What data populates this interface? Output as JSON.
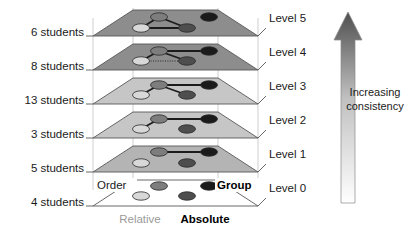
{
  "figure": {
    "type": "diagram",
    "width": 405,
    "height": 232
  },
  "colors": {
    "plane_dark": "#8d8d8d",
    "plane_mid": "#b4b4b4",
    "plane_light": "#c6c6c6",
    "plane_empty": "#ffffff",
    "edge": "#58585a",
    "pillar": "#c9c9c9",
    "connector": "#1b1b1b",
    "node_light": "#d8d8d8",
    "node_mid": "#8a8a8a",
    "node_dark": "#5a5a5a",
    "node_black": "#1b1b1b",
    "text": "#1a1a1a",
    "text_gray": "#9a9a9a",
    "arrow_top": "#595959",
    "arrow_bottom": "#ffffff"
  },
  "left_labels": [
    {
      "text": "6 students",
      "level": 5
    },
    {
      "text": "8 students",
      "level": 4
    },
    {
      "text": "13 students",
      "level": 3
    },
    {
      "text": "3 students",
      "level": 2
    },
    {
      "text": "5 students",
      "level": 1
    },
    {
      "text": "4 students",
      "level": 0
    }
  ],
  "right_labels": [
    {
      "text": "Level 5"
    },
    {
      "text": "Level 4"
    },
    {
      "text": "Level 3"
    },
    {
      "text": "Level 2"
    },
    {
      "text": "Level 1"
    },
    {
      "text": "Level 0"
    }
  ],
  "axis_labels": {
    "back_left": "Order",
    "back_right": "Group",
    "front_left": "Relative",
    "front_right": "Absolute"
  },
  "arrow": {
    "line1": "Increasing",
    "line2": "consistency",
    "direction": "up"
  },
  "levels": [
    {
      "name": "Level 5",
      "students": "6 students",
      "fill": "#8d8d8d",
      "nodes": [
        {
          "id": "relative-order",
          "shade": "#d8d8d8"
        },
        {
          "id": "absolute-order",
          "shade": "#7d7d7d"
        },
        {
          "id": "relative-group",
          "shade": "#4e4e4e"
        },
        {
          "id": "absolute-group",
          "shade": "#1b1b1b"
        }
      ],
      "links": [
        {
          "from": "relative-order",
          "to": "absolute-order",
          "style": "solid"
        },
        {
          "from": "absolute-order",
          "to": "relative-group",
          "style": "solid"
        },
        {
          "from": "relative-group",
          "to": "relative-order",
          "style": "solid"
        }
      ]
    },
    {
      "name": "Level 4",
      "students": "8 students",
      "fill": "#8d8d8d",
      "nodes": [
        {
          "id": "relative-order",
          "shade": "#d8d8d8"
        },
        {
          "id": "absolute-order",
          "shade": "#7d7d7d"
        },
        {
          "id": "relative-group",
          "shade": "#4e4e4e"
        },
        {
          "id": "absolute-group",
          "shade": "#1b1b1b"
        }
      ],
      "links": [
        {
          "from": "relative-order",
          "to": "absolute-order",
          "style": "solid"
        },
        {
          "from": "absolute-order",
          "to": "relative-group",
          "style": "solid"
        },
        {
          "from": "relative-order",
          "to": "relative-group",
          "style": "dotted"
        },
        {
          "from": "absolute-order",
          "to": "absolute-group",
          "style": "solid"
        }
      ]
    },
    {
      "name": "Level 3",
      "students": "13 students",
      "fill": "#c6c6c6",
      "nodes": [
        {
          "id": "relative-order",
          "shade": "#d8d8d8"
        },
        {
          "id": "absolute-order",
          "shade": "#7d7d7d"
        },
        {
          "id": "relative-group",
          "shade": "#4e4e4e"
        },
        {
          "id": "absolute-group",
          "shade": "#1b1b1b"
        }
      ],
      "links": [
        {
          "from": "relative-order",
          "to": "absolute-order",
          "style": "solid"
        },
        {
          "from": "absolute-order",
          "to": "relative-group",
          "style": "solid"
        },
        {
          "from": "absolute-order",
          "to": "absolute-group",
          "style": "solid"
        }
      ]
    },
    {
      "name": "Level 2",
      "students": "3 students",
      "fill": "#c6c6c6",
      "nodes": [
        {
          "id": "relative-order",
          "shade": "#d8d8d8"
        },
        {
          "id": "absolute-order",
          "shade": "#7d7d7d"
        },
        {
          "id": "relative-group",
          "shade": "#4e4e4e"
        },
        {
          "id": "absolute-group",
          "shade": "#1b1b1b"
        }
      ],
      "links": [
        {
          "from": "relative-order",
          "to": "absolute-order",
          "style": "solid"
        },
        {
          "from": "absolute-order",
          "to": "absolute-group",
          "style": "solid"
        }
      ]
    },
    {
      "name": "Level 1",
      "students": "5 students",
      "fill": "#b4b4b4",
      "nodes": [
        {
          "id": "relative-order",
          "shade": "#d8d8d8"
        },
        {
          "id": "absolute-order",
          "shade": "#7d7d7d"
        },
        {
          "id": "relative-group",
          "shade": "#4e4e4e"
        },
        {
          "id": "absolute-group",
          "shade": "#1b1b1b"
        }
      ],
      "links": [
        {
          "from": "absolute-order",
          "to": "absolute-group",
          "style": "solid"
        }
      ]
    },
    {
      "name": "Level 0",
      "students": "4 students",
      "fill": "#ffffff",
      "nodes": [
        {
          "id": "relative-order",
          "shade": "#d8d8d8"
        },
        {
          "id": "absolute-order",
          "shade": "#7d7d7d"
        },
        {
          "id": "relative-group",
          "shade": "#4e4e4e"
        },
        {
          "id": "absolute-group",
          "shade": "#1b1b1b"
        }
      ],
      "links": []
    }
  ]
}
